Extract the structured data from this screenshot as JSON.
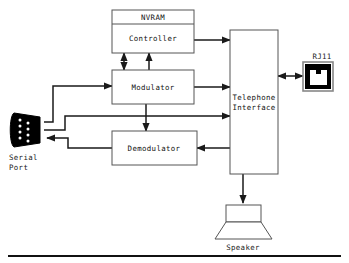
{
  "diagram": {
    "blocks": [
      {
        "id": "nvram",
        "label": "NVRAM"
      },
      {
        "id": "controller",
        "label": "Controller"
      },
      {
        "id": "modulator",
        "label": "Modulator"
      },
      {
        "id": "demodulator",
        "label": "Demodulator"
      },
      {
        "id": "telephone",
        "label_line1": "Telephone",
        "label_line2": "Interface"
      }
    ],
    "peripherals": [
      {
        "id": "rj11",
        "label": "RJ11"
      },
      {
        "id": "serial-port",
        "label_line1": "Serial",
        "label_line2": "Port"
      },
      {
        "id": "speaker",
        "label": "Speaker"
      }
    ],
    "colors": {
      "background": "#ffffff",
      "box_stroke": "#555555",
      "box_fill": "#ffffff",
      "wire": "#1a1a1a",
      "text": "#111111",
      "connector_body": "#000000",
      "connector_pin": "#ffffff",
      "rule": "#111111"
    }
  }
}
